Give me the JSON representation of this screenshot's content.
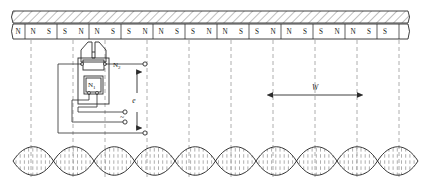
{
  "figure": {
    "type": "technical-diagram"
  },
  "scale_bar": {
    "name": "magnetized-scale-backing",
    "hatch_style": "diagonal",
    "stroke_color": "#2b2b2b"
  },
  "poles": {
    "labels": [
      "N",
      "N",
      "S",
      "S",
      "N",
      "N",
      "S",
      "S",
      "N",
      "N",
      "S",
      "S",
      "N",
      "N",
      "S",
      "S",
      "N",
      "N",
      "S",
      "S",
      "N",
      "N",
      "S",
      "S"
    ],
    "segment_boundaries_px": [
      17,
      38,
      62,
      86,
      110,
      134,
      158,
      182,
      206,
      230,
      254,
      278,
      302,
      326,
      350,
      374,
      398,
      414
    ]
  },
  "head": {
    "outer_coil_label": "N",
    "outer_coil_sub": "2",
    "inner_coil_label": "N",
    "inner_coil_sub": "1",
    "source_symbol": "~"
  },
  "annotations": {
    "emf_label": "e",
    "pitch_label": "W"
  },
  "flux": {
    "wave_name": "flux-density-waveform",
    "lobe_count": 10,
    "hatch": "vertical-dashed"
  },
  "colors": {
    "ink": "#2b2b2b",
    "hatch": "#8a8a8a",
    "dashed": "#9a9a9a"
  }
}
